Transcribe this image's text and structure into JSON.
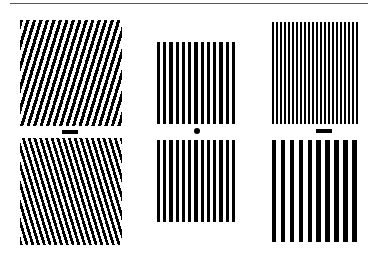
{
  "figure": {
    "colors": {
      "stripe": "#000000",
      "background": "#ffffff",
      "rule": "#555555"
    },
    "columns": [
      {
        "name": "left",
        "top": {
          "x": 20,
          "y": 20,
          "w": 102,
          "h": 106,
          "angle_deg": 17,
          "period": 6.2,
          "duty": 0.5
        },
        "marker": {
          "type": "bar",
          "x": 62,
          "y": 130,
          "w": 16,
          "h": 4
        },
        "bottom": {
          "x": 20,
          "y": 138,
          "w": 102,
          "h": 107,
          "angle_deg": -17,
          "period": 5.5,
          "duty": 0.5
        }
      },
      {
        "name": "middle",
        "top": {
          "x": 157,
          "y": 42,
          "w": 81,
          "h": 82,
          "angle_deg": 0,
          "period": 6.25,
          "duty": 0.5,
          "count": 13
        },
        "marker": {
          "type": "dot",
          "x": 194,
          "y": 128,
          "w": 6,
          "h": 6
        },
        "bottom": {
          "x": 157,
          "y": 140,
          "w": 81,
          "h": 82,
          "angle_deg": 0,
          "period": 6.25,
          "duty": 0.5,
          "count": 13
        }
      },
      {
        "name": "right",
        "top": {
          "x": 272,
          "y": 22,
          "w": 88,
          "h": 102,
          "angle_deg": 0,
          "period": 4.0,
          "duty": 0.55,
          "count": 22
        },
        "marker": {
          "type": "bar",
          "x": 316,
          "y": 129,
          "w": 16,
          "h": 4
        },
        "bottom": {
          "x": 272,
          "y": 140,
          "w": 88,
          "h": 102,
          "angle_deg": 0,
          "period": 8.9,
          "duty": 0.5,
          "count": 10
        }
      }
    ]
  }
}
